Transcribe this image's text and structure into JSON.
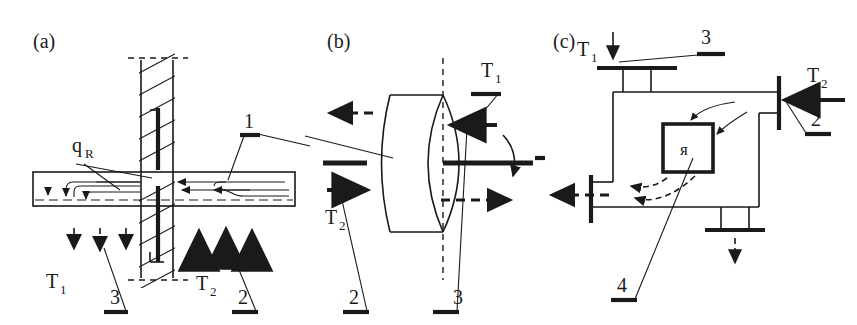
{
  "figure": {
    "kind": "technical-line-diagram",
    "background_color": "#ffffff",
    "ink_color": "#1a1a1a",
    "panel_count": 3
  },
  "panels": [
    {
      "id": "a",
      "label": "(a)",
      "description": "Cross-section of a wall with a horizontal channel and radiant heat flux",
      "labels": {
        "flux": "q",
        "flux_sub": "R",
        "temp1": "T",
        "temp1_sub": "1",
        "temp2": "T",
        "temp2_sub": "2",
        "callout1": "1",
        "callout2": "2",
        "callout3": "3"
      }
    },
    {
      "id": "b",
      "label": "(b)",
      "description": "Rotating cylindrical body on a horizontal shaft with vertical axis of symmetry",
      "labels": {
        "temp1": "T",
        "temp1_sub": "1",
        "temp2": "T",
        "temp2_sub": "2",
        "callout1": "1",
        "callout2": "2",
        "callout3": "3"
      }
    },
    {
      "id": "c",
      "label": "(c)",
      "description": "Piping network with flanges and an internal core element",
      "labels": {
        "temp1": "T",
        "temp1_sub": "1",
        "temp2": "T",
        "temp2_sub": "2",
        "callout2": "2",
        "callout3": "3",
        "callout4": "4",
        "core_symbol": "я"
      }
    }
  ]
}
